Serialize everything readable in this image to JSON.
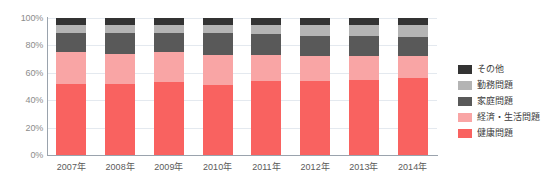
{
  "chart_data": {
    "type": "bar",
    "stacked": true,
    "stack_total": 100,
    "title": "",
    "subtitle": "",
    "xlabel": "",
    "ylabel": "",
    "categories": [
      "2007年",
      "2008年",
      "2009年",
      "2010年",
      "2011年",
      "2012年",
      "2013年",
      "2014年"
    ],
    "ylim": [
      0,
      100
    ],
    "yticks": [
      0,
      20,
      40,
      60,
      80,
      100
    ],
    "ytick_labels": [
      "0%",
      "20%",
      "40%",
      "60%",
      "80%",
      "100%"
    ],
    "grid": true,
    "legend_position": "right",
    "series": [
      {
        "name": "健康問題",
        "color": "#f96260",
        "values": [
          52,
          52,
          53,
          51,
          54,
          54,
          55,
          56
        ]
      },
      {
        "name": "経済・生活問題",
        "color": "#f9a5a5",
        "values": [
          23,
          22,
          22,
          22,
          19,
          18,
          17,
          16
        ]
      },
      {
        "name": "家庭問題",
        "color": "#595959",
        "values": [
          14,
          15,
          14,
          16,
          15,
          15,
          15,
          14
        ]
      },
      {
        "name": "勤務問題",
        "color": "#b4b4b4",
        "values": [
          6,
          6,
          6,
          6,
          7,
          8,
          8,
          9
        ]
      },
      {
        "name": "その他",
        "color": "#333333",
        "values": [
          5,
          5,
          5,
          5,
          5,
          5,
          5,
          5
        ]
      }
    ]
  },
  "legend": {
    "items": [
      {
        "label": "その他",
        "color": "#333333"
      },
      {
        "label": "勤務問題",
        "color": "#b4b4b4"
      },
      {
        "label": "家庭問題",
        "color": "#595959"
      },
      {
        "label": "経済・生活問題",
        "color": "#f9a5a5"
      },
      {
        "label": "健康問題",
        "color": "#f96260"
      }
    ]
  },
  "axes": {
    "y_labels": [
      "100%",
      "80%",
      "60%",
      "40%",
      "20%",
      "0%"
    ],
    "x_labels": [
      "2007年",
      "2008年",
      "2009年",
      "2010年",
      "2011年",
      "2012年",
      "2013年",
      "2014年"
    ]
  },
  "style": {
    "gridline_color": "#e4e9ef",
    "axis_color": "#9aa3ad",
    "y_label_color": "#8c8c8c",
    "x_label_color": "#5a5a5a",
    "legend_label_color": "#3c3c3c",
    "background": "#ffffff"
  }
}
